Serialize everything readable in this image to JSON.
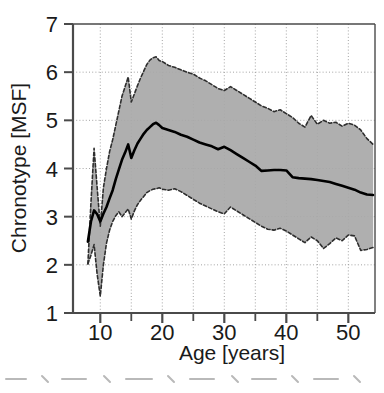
{
  "chart_data": {
    "type": "line",
    "title": "",
    "subtitle": "",
    "xlabel": "Age [years]",
    "ylabel": "Chronotype [MSF]",
    "xlim": [
      5.6,
      54.3
    ],
    "ylim": [
      1,
      7
    ],
    "xticks": [
      10,
      20,
      30,
      40,
      50
    ],
    "xticklabels": [
      "10",
      "20",
      "30",
      "40",
      "50"
    ],
    "xminorticks": [
      5,
      15,
      25,
      35,
      45
    ],
    "yticks": [
      1,
      2,
      3,
      4,
      5,
      6,
      7
    ],
    "yticklabels": [
      "1",
      "2",
      "3",
      "4",
      "5",
      "6",
      "7"
    ],
    "grid": true,
    "grid_style": "dotted",
    "legend": null,
    "band_fill_color": "#a8a8a8",
    "band_line_color": "#3a3a3a",
    "mean_line_color": "#000000",
    "axis_color": "#4a4a4a",
    "series": [
      {
        "name": "Mean chronotype (MSF)",
        "style": "solid",
        "x": [
          8.0,
          8.5,
          9.0,
          9.5,
          10.0,
          10.5,
          11.0,
          11.5,
          12.0,
          12.5,
          13.0,
          13.5,
          14.0,
          14.5,
          15.0,
          15.5,
          16.0,
          16.5,
          17.0,
          17.5,
          18.0,
          18.5,
          19.0,
          19.5,
          20.0,
          21.0,
          22.0,
          23.0,
          24.0,
          25.0,
          26.0,
          27.0,
          28.0,
          29.0,
          30.0,
          31.0,
          32.0,
          33.0,
          34.0,
          35.0,
          36.0,
          37.0,
          38.0,
          39.0,
          40.0,
          41.0,
          42.0,
          43.0,
          44.0,
          45.0,
          46.0,
          47.0,
          48.0,
          49.0,
          50.0,
          51.0,
          52.0,
          53.0,
          54.0
        ],
        "y": [
          2.48,
          2.9,
          3.13,
          3.05,
          2.9,
          3.06,
          3.2,
          3.38,
          3.55,
          3.78,
          3.98,
          4.18,
          4.33,
          4.5,
          4.22,
          4.38,
          4.52,
          4.62,
          4.72,
          4.8,
          4.86,
          4.92,
          4.95,
          4.9,
          4.84,
          4.8,
          4.76,
          4.7,
          4.66,
          4.6,
          4.54,
          4.5,
          4.46,
          4.4,
          4.45,
          4.38,
          4.3,
          4.22,
          4.14,
          4.06,
          3.95,
          3.96,
          3.97,
          3.97,
          3.96,
          3.82,
          3.8,
          3.79,
          3.78,
          3.76,
          3.74,
          3.72,
          3.68,
          3.64,
          3.6,
          3.56,
          3.5,
          3.46,
          3.45
        ]
      },
      {
        "name": "Upper band (dashed)",
        "style": "dashed",
        "x": [
          8.0,
          8.5,
          9.0,
          9.5,
          10.0,
          10.5,
          11.0,
          11.5,
          12.0,
          12.5,
          13.0,
          13.5,
          14.0,
          14.5,
          15.0,
          15.5,
          16.0,
          16.5,
          17.0,
          17.5,
          18.0,
          18.5,
          19.0,
          19.5,
          20.0,
          21.0,
          22.0,
          23.0,
          24.0,
          25.0,
          26.0,
          27.0,
          28.0,
          29.0,
          30.0,
          31.0,
          32.0,
          33.0,
          34.0,
          35.0,
          36.0,
          37.0,
          38.0,
          39.0,
          40.0,
          41.0,
          42.0,
          43.0,
          44.0,
          45.0,
          46.0,
          47.0,
          48.0,
          49.0,
          50.0,
          51.0,
          52.0,
          53.0,
          54.0
        ],
        "y": [
          2.02,
          3.3,
          4.42,
          3.6,
          2.8,
          3.6,
          4.0,
          4.35,
          4.6,
          4.9,
          5.2,
          5.5,
          5.7,
          5.9,
          5.38,
          5.55,
          5.72,
          5.88,
          6.02,
          6.16,
          6.25,
          6.3,
          6.32,
          6.24,
          6.22,
          6.14,
          6.1,
          6.05,
          6.0,
          5.96,
          5.88,
          5.82,
          5.74,
          5.66,
          5.62,
          5.7,
          5.62,
          5.54,
          5.46,
          5.38,
          5.3,
          5.25,
          5.18,
          5.22,
          5.14,
          5.06,
          4.94,
          4.86,
          5.1,
          4.92,
          5.0,
          4.94,
          4.96,
          4.88,
          4.94,
          4.9,
          4.8,
          4.62,
          4.5
        ]
      },
      {
        "name": "Lower band (dashed)",
        "style": "dashed",
        "x": [
          8.0,
          8.5,
          9.0,
          9.5,
          10.0,
          10.5,
          11.0,
          11.5,
          12.0,
          12.5,
          13.0,
          13.5,
          14.0,
          14.5,
          15.0,
          15.5,
          16.0,
          16.5,
          17.0,
          17.5,
          18.0,
          18.5,
          19.0,
          19.5,
          20.0,
          21.0,
          22.0,
          23.0,
          24.0,
          25.0,
          26.0,
          27.0,
          28.0,
          29.0,
          30.0,
          31.0,
          32.0,
          33.0,
          34.0,
          35.0,
          36.0,
          37.0,
          38.0,
          39.0,
          40.0,
          41.0,
          42.0,
          43.0,
          44.0,
          45.0,
          46.0,
          47.0,
          48.0,
          49.0,
          50.0,
          51.0,
          52.0,
          53.0,
          54.0
        ],
        "y": [
          2.02,
          2.2,
          2.42,
          1.8,
          1.35,
          2.0,
          2.45,
          2.72,
          2.9,
          3.02,
          3.1,
          3.0,
          3.08,
          3.16,
          2.95,
          3.12,
          3.25,
          3.34,
          3.42,
          3.5,
          3.54,
          3.57,
          3.58,
          3.6,
          3.57,
          3.55,
          3.58,
          3.52,
          3.44,
          3.36,
          3.28,
          3.22,
          3.16,
          3.1,
          3.06,
          3.2,
          3.12,
          3.04,
          2.96,
          2.88,
          2.8,
          2.74,
          2.72,
          2.76,
          2.7,
          2.62,
          2.54,
          2.46,
          2.58,
          2.5,
          2.34,
          2.44,
          2.56,
          2.5,
          2.62,
          2.6,
          2.3,
          2.32,
          2.36
        ]
      }
    ]
  },
  "axes": {
    "xlabel": "Age [years]",
    "ylabel": "Chronotype [MSF]"
  }
}
